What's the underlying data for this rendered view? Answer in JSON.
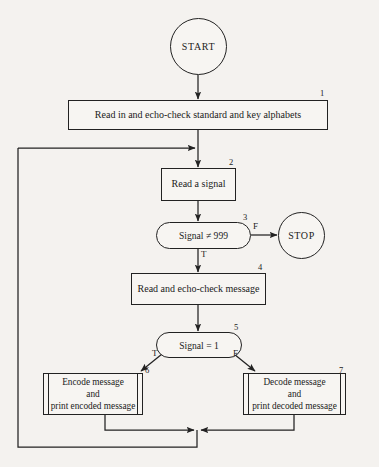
{
  "diagram": {
    "background_color": "#f4f2ef",
    "line_color": "#222222",
    "nodes": [
      {
        "id": "start",
        "shape": "terminator",
        "label": "START",
        "number": ""
      },
      {
        "id": "box1",
        "shape": "process",
        "label": "Read in and echo-check standard and key alphabets",
        "number": "1"
      },
      {
        "id": "box2",
        "shape": "process",
        "label": "Read a signal",
        "number": "2"
      },
      {
        "id": "dec3",
        "shape": "decision",
        "label": "Signal ≠ 999",
        "number": "3"
      },
      {
        "id": "stop",
        "shape": "terminator",
        "label": "STOP",
        "number": ""
      },
      {
        "id": "box4",
        "shape": "process",
        "label": "Read and echo-check message",
        "number": "4"
      },
      {
        "id": "dec5",
        "shape": "decision",
        "label": "Signal  =  1",
        "number": "5"
      },
      {
        "id": "box6",
        "shape": "subroutine",
        "label": "Encode message\nand\nprint encoded message",
        "number": "6"
      },
      {
        "id": "box7",
        "shape": "subroutine",
        "label": "Decode message\nand\nprint decoded message",
        "number": "7"
      }
    ],
    "branch_labels": {
      "dec3_false": "F",
      "dec3_true": "T",
      "dec5_true": "T",
      "dec5_false": "F"
    }
  }
}
